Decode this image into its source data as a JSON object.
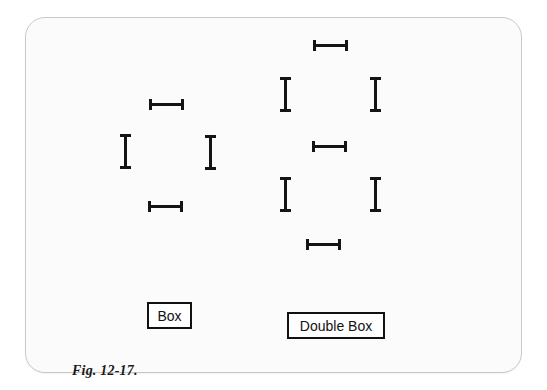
{
  "figure": {
    "caption": "Fig. 12-17.",
    "frame": {
      "border_color": "#c9c9c9",
      "background_color": "#fbfbfb",
      "corner_radius_px": 20
    },
    "stroke_color": "#141414",
    "page_background": "#ffffff"
  },
  "groups": [
    {
      "id": "box",
      "label": "Box",
      "label_box": {
        "x": 146,
        "y": 301,
        "width": 45,
        "height": 27
      },
      "segment_count": 4,
      "segments": [
        {
          "name": "box-top-bar",
          "orientation": "horizontal",
          "x": 148,
          "y": 98,
          "length": 35,
          "thickness": 11
        },
        {
          "name": "box-left-bar",
          "orientation": "vertical",
          "x": 119,
          "y": 133,
          "length": 35,
          "thickness": 11
        },
        {
          "name": "box-right-bar",
          "orientation": "vertical",
          "x": 204,
          "y": 134,
          "length": 35,
          "thickness": 11
        },
        {
          "name": "box-bottom-bar",
          "orientation": "horizontal",
          "x": 147,
          "y": 200,
          "length": 35,
          "thickness": 11
        }
      ]
    },
    {
      "id": "double-box",
      "label": "Double Box",
      "label_box": {
        "x": 286,
        "y": 311,
        "width": 98,
        "height": 27
      },
      "segment_count": 7,
      "segments": [
        {
          "name": "double-box-top-bar",
          "orientation": "horizontal",
          "x": 312,
          "y": 39,
          "length": 35,
          "thickness": 11
        },
        {
          "name": "double-box-upper-left-bar",
          "orientation": "vertical",
          "x": 279,
          "y": 76,
          "length": 35,
          "thickness": 11
        },
        {
          "name": "double-box-upper-right-bar",
          "orientation": "vertical",
          "x": 369,
          "y": 76,
          "length": 35,
          "thickness": 11
        },
        {
          "name": "double-box-middle-bar",
          "orientation": "horizontal",
          "x": 311,
          "y": 140,
          "length": 35,
          "thickness": 11
        },
        {
          "name": "double-box-lower-left-bar",
          "orientation": "vertical",
          "x": 279,
          "y": 176,
          "length": 35,
          "thickness": 11
        },
        {
          "name": "double-box-lower-right-bar",
          "orientation": "vertical",
          "x": 369,
          "y": 176,
          "length": 35,
          "thickness": 11
        },
        {
          "name": "double-box-bottom-bar",
          "orientation": "horizontal",
          "x": 305,
          "y": 238,
          "length": 35,
          "thickness": 11
        }
      ]
    }
  ]
}
